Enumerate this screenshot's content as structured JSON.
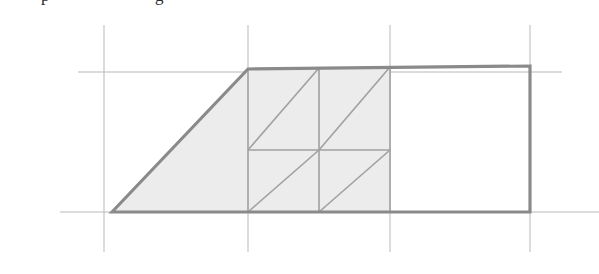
{
  "figure": {
    "background_color": "#ffffff",
    "cut_text": {
      "fragment_left": "p",
      "fragment_right": "g"
    },
    "colors": {
      "grid_line": "#b9b9b9",
      "outline": "#8a8a8a",
      "outline_dark": "#7c7c7c",
      "inner_line": "#a0a0a0",
      "fill": "#ececec"
    },
    "stroke_widths": {
      "grid": 1,
      "outline": 3.2,
      "inner": 1.6
    },
    "grid": {
      "vertical_x": [
        104,
        248,
        390,
        530
      ],
      "vertical_y_start": 25,
      "vertical_y_end": 252,
      "horizontal": [
        {
          "y": 72,
          "x_start": 78,
          "x_end": 562
        },
        {
          "y": 212,
          "x_start": 60,
          "x_end": 599
        }
      ]
    },
    "shape": {
      "name": "trapezoid",
      "vertices": [
        {
          "label": "bottom-left",
          "x": 112,
          "y": 212
        },
        {
          "label": "top-left",
          "x": 248,
          "y": 69
        },
        {
          "label": "top-right",
          "x": 530,
          "y": 66
        },
        {
          "label": "bottom-right",
          "x": 530,
          "y": 212
        }
      ]
    },
    "shaded_region": {
      "description": "left portion of trapezoid up to x=390",
      "vertices": [
        {
          "x": 112,
          "y": 212
        },
        {
          "x": 248,
          "y": 69
        },
        {
          "x": 390,
          "y": 67.5
        },
        {
          "x": 390,
          "y": 212
        }
      ]
    },
    "inner_grid": {
      "description": "2 by 2 cell grid with parallel diagonals",
      "x_left": 248,
      "x_mid": 319,
      "x_right": 390,
      "y_top": 68,
      "y_mid": 150,
      "y_bottom": 212,
      "diagonals": [
        {
          "cell": "top-left",
          "x1": 248,
          "y1": 150,
          "x2": 319,
          "y2": 68
        },
        {
          "cell": "top-right",
          "x1": 319,
          "y1": 150,
          "x2": 390,
          "y2": 67
        },
        {
          "cell": "bottom-left",
          "x1": 248,
          "y1": 212,
          "x2": 319,
          "y2": 150
        },
        {
          "cell": "bottom-right",
          "x1": 319,
          "y1": 212,
          "x2": 390,
          "y2": 150
        }
      ]
    }
  }
}
